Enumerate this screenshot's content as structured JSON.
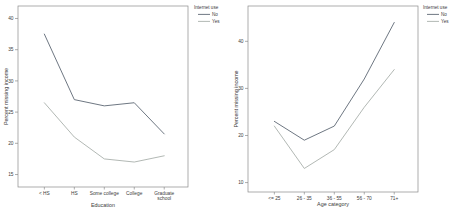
{
  "colors": {
    "series_colors": [
      "#5e6874",
      "#a9b0ab"
    ],
    "frame": "#8a8a8a",
    "tick": "#8a8a8a",
    "text": "#3c3c3c",
    "background": "#ffffff"
  },
  "legend": {
    "title": "Internet use",
    "items": [
      {
        "label": "No"
      },
      {
        "label": "Yes"
      }
    ]
  },
  "chart_data": [
    {
      "type": "line",
      "title": "",
      "xlabel": "Education",
      "ylabel": "Percent missing income",
      "categories": [
        "< HS",
        "HS",
        "Some college",
        "College",
        "Graduate school"
      ],
      "series": [
        {
          "name": "No",
          "values": [
            37.5,
            27,
            26,
            26.5,
            21.5
          ]
        },
        {
          "name": "Yes",
          "values": [
            26.5,
            21,
            17.5,
            17,
            18
          ]
        }
      ],
      "yticks": [
        15,
        20,
        25,
        30,
        35,
        40
      ],
      "ylim": [
        13,
        42
      ],
      "grid": false,
      "legend_position": "right-outside"
    },
    {
      "type": "line",
      "title": "",
      "xlabel": "Age category",
      "ylabel": "Percent missing income",
      "categories": [
        "<= 25",
        "26 - 35",
        "36 - 55",
        "56 - 70",
        "71+"
      ],
      "series": [
        {
          "name": "No",
          "values": [
            23,
            19,
            22,
            32,
            44
          ]
        },
        {
          "name": "Yes",
          "values": [
            22,
            13,
            17,
            26,
            34
          ]
        }
      ],
      "yticks": [
        10,
        20,
        30,
        40
      ],
      "ylim": [
        8,
        47.5
      ],
      "grid": false,
      "legend_position": "right-outside"
    }
  ]
}
